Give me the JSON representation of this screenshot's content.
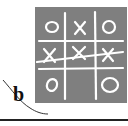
{
  "figure": {
    "label": "b",
    "board": {
      "cells": [
        [
          "O",
          "X",
          "O"
        ],
        [
          "X",
          "X",
          "X"
        ],
        [
          "O",
          "",
          "O"
        ]
      ],
      "winning_line": "row-2",
      "background_color": "#7f7f7f",
      "mark_color": "#ffffff"
    },
    "rule_color": "#222222"
  }
}
